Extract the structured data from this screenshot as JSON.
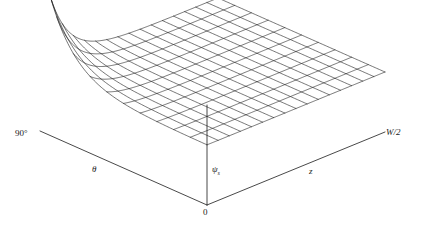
{
  "figure": {
    "type": "surface-3d-wireframe",
    "background_color": "#ffffff",
    "line_color": "#1a1a1a",
    "axis_color": "#1a1a1a"
  },
  "labels": {
    "theta_max": "90°",
    "theta_axis": "θ",
    "w_half": "W/2",
    "z_axis": "z",
    "vertical_axis": "ψ",
    "vertical_axis_sub": "s",
    "origin": "0"
  },
  "axes": {
    "origin_px": [
      207,
      205
    ],
    "left_axis_end_px": [
      40,
      131
    ],
    "right_axis_end_px": [
      385,
      132
    ],
    "vertical_axis_top_px": [
      207,
      105
    ],
    "theta_range": [
      "0",
      "90°"
    ],
    "z_range": [
      "0",
      "W/2"
    ],
    "vertical_quantity": "ψs"
  },
  "chart_data": {
    "type": "surface",
    "title": "",
    "xlabel": "θ",
    "ylabel": "z",
    "zlabel": "ψs",
    "xlim": [
      0,
      90
    ],
    "ylim": [
      0,
      1
    ],
    "zlim": [
      0,
      1
    ],
    "grid": true,
    "legend": false,
    "x_tick_labels": [
      "0",
      "90°"
    ],
    "y_tick_labels": [
      "0",
      "W/2"
    ],
    "n_theta_lines": 11,
    "n_z_lines": 17,
    "surface_model": {
      "form": "z_val = exp(-theta_norm*6.5) * exp(-z_norm*9.0)",
      "theta_norm_at_left_corner": 0,
      "peak_corner": "theta=90deg, z=0",
      "peak_value": 1.0,
      "plateau_value": 0.0
    },
    "theta_samples": [
      0,
      9,
      18,
      27,
      36,
      45,
      54,
      63,
      72,
      81,
      90
    ],
    "z_samples": [
      0,
      0.0625,
      0.125,
      0.1875,
      0.25,
      0.3125,
      0.375,
      0.4375,
      0.5,
      0.5625,
      0.625,
      0.6875,
      0.75,
      0.8125,
      0.875,
      0.9375,
      1.0
    ]
  }
}
